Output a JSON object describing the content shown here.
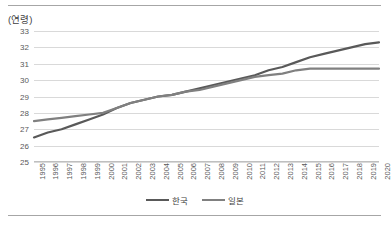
{
  "chart_data": {
    "type": "line",
    "title": "",
    "subtitle": "",
    "xlabel": "",
    "ylabel": "(연령)",
    "ylim": [
      25,
      33
    ],
    "ytick_step": 1,
    "yticks": [
      33,
      32,
      31,
      30,
      29,
      28,
      27,
      26,
      25
    ],
    "grid": true,
    "legend_position": "bottom-center",
    "categories": [
      "1995",
      "1996",
      "1997",
      "1998",
      "1999",
      "2000",
      "2001",
      "2002",
      "2003",
      "2004",
      "2005",
      "2006",
      "2007",
      "2008",
      "2009",
      "2010",
      "2011",
      "2012",
      "2013",
      "2014",
      "2015",
      "2016",
      "2017",
      "2018",
      "2019",
      "2020"
    ],
    "series": [
      {
        "name": "한국",
        "color": "#595959",
        "values": [
          26.5,
          26.8,
          27.0,
          27.3,
          27.6,
          27.9,
          28.3,
          28.6,
          28.8,
          29.0,
          29.1,
          29.3,
          29.5,
          29.7,
          29.9,
          30.1,
          30.3,
          30.6,
          30.8,
          31.1,
          31.4,
          31.6,
          31.8,
          32.0,
          32.2,
          32.3
        ]
      },
      {
        "name": "일본",
        "color": "#808080",
        "values": [
          27.5,
          27.6,
          27.7,
          27.8,
          27.9,
          28.0,
          28.3,
          28.6,
          28.8,
          29.0,
          29.1,
          29.3,
          29.4,
          29.6,
          29.8,
          30.0,
          30.2,
          30.3,
          30.4,
          30.6,
          30.7,
          30.7,
          30.7,
          30.7,
          30.7,
          30.7
        ]
      }
    ]
  },
  "legend": {
    "items": [
      {
        "label": "한국",
        "color": "#595959"
      },
      {
        "label": "일본",
        "color": "#808080"
      }
    ]
  },
  "axis": {
    "y_unit_label": "(연령)"
  }
}
